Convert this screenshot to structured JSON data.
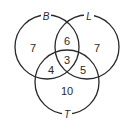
{
  "diagram": {
    "type": "venn",
    "sets": [
      {
        "name": "B",
        "label": "B"
      },
      {
        "name": "L",
        "label": "L"
      },
      {
        "name": "T",
        "label": "T"
      }
    ],
    "regions": {
      "B_only": "7",
      "L_only": "7",
      "T_only": "10",
      "B_L_only": "6",
      "B_T_only": "4",
      "L_T_only": "5",
      "B_L_T": "3"
    },
    "stroke_color": "#2a2a2a",
    "background": "#ffffff"
  }
}
